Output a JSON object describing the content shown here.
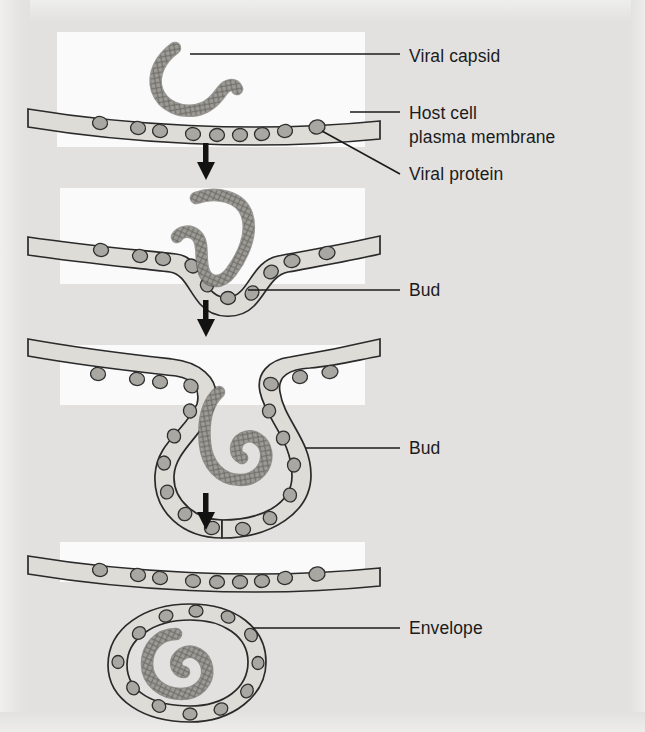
{
  "figure": {
    "background_color": "#e2e1df",
    "panel_color": "#fafafa",
    "ink_color": "#1b1b1b",
    "membrane_fill": "#dedcd7",
    "protein_fill": "#a9a7a1",
    "capsid_fill": "#8e8c86"
  },
  "labels": [
    {
      "id": "viral-capsid",
      "text": "Viral capsid",
      "x": 409,
      "y": 62
    },
    {
      "id": "host-cell",
      "text": "Host cell",
      "x": 409,
      "y": 119
    },
    {
      "id": "plasma-membrane",
      "text": "plasma membrane",
      "x": 409,
      "y": 143
    },
    {
      "id": "viral-protein",
      "text": "Viral protein",
      "x": 409,
      "y": 180
    },
    {
      "id": "bud-1",
      "text": "Bud",
      "x": 409,
      "y": 296
    },
    {
      "id": "bud-2",
      "text": "Bud",
      "x": 409,
      "y": 454
    },
    {
      "id": "envelope",
      "text": "Envelope",
      "x": 409,
      "y": 634
    }
  ],
  "panels": [
    {
      "id": "panel-1",
      "step": 1,
      "caption": "Viral capsid approaches the host cell plasma membrane studded with viral proteins"
    },
    {
      "id": "panel-2",
      "step": 2,
      "caption": "Membrane begins to invaginate forming a shallow bud around the capsid"
    },
    {
      "id": "panel-3",
      "step": 3,
      "caption": "Bud deepens and the coiled capsid is enclosed by the membrane"
    },
    {
      "id": "panel-4",
      "step": 4,
      "caption": "Enveloped virion is released, capsid surrounded by the membrane envelope"
    }
  ],
  "arrows": [
    {
      "id": "arrow-1",
      "from_panel": "panel-1",
      "to_panel": "panel-2"
    },
    {
      "id": "arrow-2",
      "from_panel": "panel-2",
      "to_panel": "panel-3"
    },
    {
      "id": "arrow-3",
      "from_panel": "panel-3",
      "to_panel": "panel-4"
    }
  ]
}
